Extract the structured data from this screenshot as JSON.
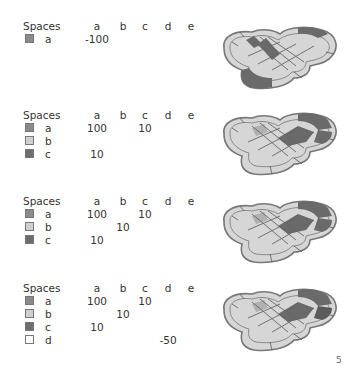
{
  "columns": [
    "a",
    "b",
    "c",
    "d",
    "e"
  ],
  "header_label": "Spaces",
  "colors": {
    "a": "#8a8a8a",
    "b": "#d0d0d0",
    "c": "#6e6e6e",
    "d": "#ffffff"
  },
  "blocks": [
    {
      "top": 20,
      "rows": [
        {
          "label": "a",
          "color": "#8a8a8a",
          "values": [
            "-100",
            "",
            "",
            "",
            ""
          ]
        }
      ],
      "board": {
        "top": 22,
        "dark_regions": [
          "left-bottom",
          "center-diagonal",
          "right-top"
        ]
      }
    },
    {
      "top": 109,
      "rows": [
        {
          "label": "a",
          "color": "#8a8a8a",
          "values": [
            "100",
            "",
            "10",
            "",
            ""
          ]
        },
        {
          "label": "b",
          "color": "#d0d0d0",
          "values": [
            "",
            "",
            "",
            "",
            ""
          ]
        },
        {
          "label": "c",
          "color": "#6e6e6e",
          "values": [
            "10",
            "",
            "",
            "",
            ""
          ]
        }
      ],
      "board": {
        "top": 108,
        "dark_regions": [
          "right-top",
          "right"
        ]
      }
    },
    {
      "top": 195,
      "rows": [
        {
          "label": "a",
          "color": "#8a8a8a",
          "values": [
            "100",
            "",
            "10",
            "",
            ""
          ]
        },
        {
          "label": "b",
          "color": "#d0d0d0",
          "values": [
            "",
            "10",
            "",
            "",
            ""
          ]
        },
        {
          "label": "c",
          "color": "#6e6e6e",
          "values": [
            "10",
            "",
            "",
            "",
            ""
          ]
        }
      ],
      "board": {
        "top": 196,
        "dark_regions": [
          "right-top",
          "right"
        ]
      }
    },
    {
      "top": 282,
      "rows": [
        {
          "label": "a",
          "color": "#8a8a8a",
          "values": [
            "100",
            "",
            "10",
            "",
            ""
          ]
        },
        {
          "label": "b",
          "color": "#d0d0d0",
          "values": [
            "",
            "10",
            "",
            "",
            ""
          ]
        },
        {
          "label": "c",
          "color": "#6e6e6e",
          "values": [
            "10",
            "",
            "",
            "",
            ""
          ]
        },
        {
          "label": "d",
          "color": "#ffffff",
          "values": [
            "",
            "",
            "",
            "-50",
            ""
          ]
        }
      ],
      "board": {
        "top": 284,
        "dark_regions": [
          "right-top",
          "right"
        ]
      }
    }
  ],
  "page_number": "5"
}
